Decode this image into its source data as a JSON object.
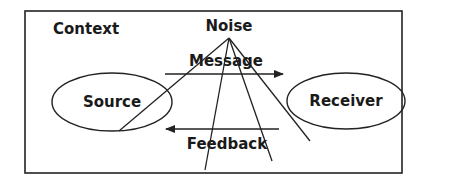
{
  "diagram": {
    "context_label": "Context",
    "noise_label": "Noise",
    "message_label": "Message",
    "feedback_label": "Feedback",
    "nodes": [
      {
        "id": "source",
        "label": "Source"
      },
      {
        "id": "receiver",
        "label": "Receiver"
      }
    ],
    "edges": [
      {
        "from": "source",
        "to": "receiver",
        "label": "Message",
        "direction": "right"
      },
      {
        "from": "receiver",
        "to": "source",
        "label": "Feedback",
        "direction": "left"
      }
    ],
    "noise_lines": 4,
    "colors": {
      "line": "#222222",
      "text": "#1a1a1a",
      "background": "#ffffff"
    }
  }
}
